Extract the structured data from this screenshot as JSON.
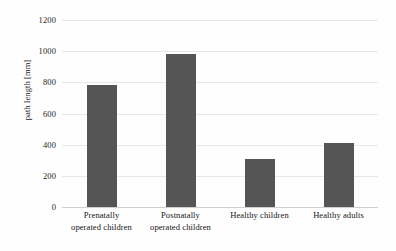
{
  "chart_data": {
    "type": "bar",
    "title": "",
    "xlabel": "",
    "ylabel": "path length [mm]",
    "categories": [
      "Prenatally operated children",
      "Postnatally operated children",
      "Healthy children",
      "Healthy adults"
    ],
    "category_lines": [
      [
        "Prenatally",
        "operated children"
      ],
      [
        "Postnatally",
        "operated children"
      ],
      [
        "Healthy children",
        ""
      ],
      [
        "Healthy adults",
        ""
      ]
    ],
    "values": [
      785,
      980,
      310,
      410
    ],
    "ylim": [
      0,
      1200
    ],
    "ytick_labels": [
      "0",
      "200",
      "400",
      "600",
      "800",
      "1000",
      "1200"
    ],
    "ytick_values": [
      0,
      200,
      400,
      600,
      800,
      1000,
      1200
    ],
    "grid": true,
    "legend": "none",
    "bar_color": "#555555",
    "gridline_color": "#e8e8e8",
    "background_color": "#fefefe",
    "text_color": "#141414"
  }
}
